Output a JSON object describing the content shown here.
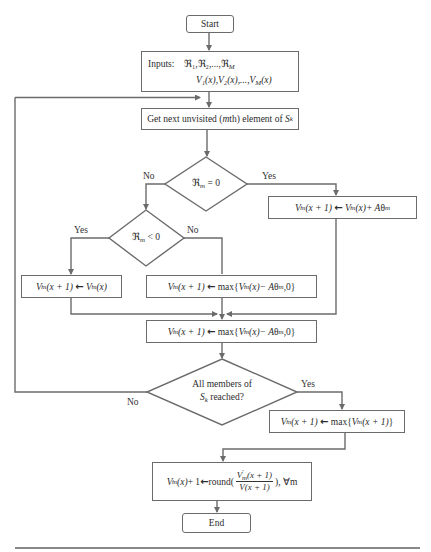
{
  "diagram": {
    "type": "flowchart",
    "colors": {
      "line": "#6b6b6b",
      "text": "#2b2b2b",
      "background": "#ffffff"
    },
    "nodes": {
      "start": {
        "label": "Start",
        "shape": "rounded-rect"
      },
      "inputs": {
        "shape": "rect",
        "label": "Inputs:",
        "line1": "ℜ1,ℜ2,...,ℜM",
        "line2": "V1(x),V2(x),...,VM(x)"
      },
      "get_next": {
        "shape": "rect",
        "label": "Get next unvisited (mth) element of Sk"
      },
      "decision_zero": {
        "shape": "diamond",
        "label": "ℜm = 0",
        "yes": "Yes",
        "no": "No"
      },
      "increase": {
        "shape": "rect",
        "label": "V'm(x + 1) ← V'm(x) + Aθm"
      },
      "decision_negative": {
        "shape": "diamond",
        "label": "ℜm < 0",
        "yes": "Yes",
        "no": "No"
      },
      "keep": {
        "shape": "rect",
        "label": "V'm(x + 1) ← V'm(x)"
      },
      "decrease": {
        "shape": "rect",
        "label": "V'm(x + 1) ← max{V'm(x) − Aθm,0}"
      },
      "merge": {
        "shape": "rect",
        "label": "V'm(x + 1) ← max{V'm(x) − Aθm,0}"
      },
      "decision_all": {
        "shape": "diamond",
        "label_line1": "All members of",
        "label_line2": "Sk reached?",
        "yes": "Yes",
        "no": "No"
      },
      "max_step": {
        "shape": "rect",
        "label": "V'm(x + 1) ← max{V'm(x + 1)}"
      },
      "round_step": {
        "shape": "rect",
        "label": "V'm(x) + 1 ← round(V'm(x + 1) / V(x + 1)), ∀m"
      },
      "end": {
        "label": "End",
        "shape": "rounded-rect"
      }
    },
    "text": {
      "start": "Start",
      "end": "End",
      "inputs_label": "Inputs:",
      "get_next_a": "Get next unvisited (",
      "get_next_m": "m",
      "get_next_b": "th) element of ",
      "S": "S",
      "k": "k",
      "frak_R": "ℜ",
      "m": "m",
      "M": "M",
      "V": "V",
      "prime": "′",
      "eq0": " = 0",
      "lt0": " < 0",
      "yes": "Yes",
      "no": "No",
      "all_members": "All members of",
      "reached": " reached?",
      "x_plus_1": "(x + 1)",
      "arrow": "←",
      "of_x": "(x)",
      "plus_A": " + A",
      "theta": "θ",
      "max_open": "max{",
      "minus_A": " − A",
      "comma0": ",0}",
      "close_brace": "}",
      "round_open": "round(",
      "round_close": "), ∀m",
      "plus_one": " + 1 ",
      "inputs_r": "ℜ₁,ℜ₂,...,ℜ",
      "inputs_v": "V₁(x),V₂(x),...,V",
      "v_denom": "V(x + 1)"
    }
  }
}
